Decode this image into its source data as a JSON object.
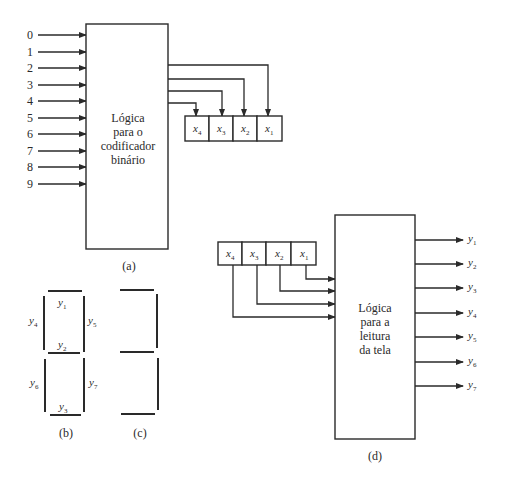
{
  "figure_a": {
    "inputs": [
      "0",
      "1",
      "2",
      "3",
      "4",
      "5",
      "6",
      "7",
      "8",
      "9"
    ],
    "block_label": [
      "Lógica",
      "para o",
      "codificador",
      "binário"
    ],
    "register": [
      {
        "name": "x",
        "sub": "4"
      },
      {
        "name": "x",
        "sub": "3"
      },
      {
        "name": "x",
        "sub": "2"
      },
      {
        "name": "x",
        "sub": "1"
      }
    ],
    "caption": "(a)"
  },
  "figure_b": {
    "segments": [
      {
        "name": "y",
        "sub": "1"
      },
      {
        "name": "y",
        "sub": "2"
      },
      {
        "name": "y",
        "sub": "3"
      },
      {
        "name": "y",
        "sub": "4"
      },
      {
        "name": "y",
        "sub": "5"
      },
      {
        "name": "y",
        "sub": "6"
      },
      {
        "name": "y",
        "sub": "7"
      }
    ],
    "caption": "(b)"
  },
  "figure_c": {
    "caption": "(c)"
  },
  "figure_d": {
    "register": [
      {
        "name": "x",
        "sub": "4"
      },
      {
        "name": "x",
        "sub": "3"
      },
      {
        "name": "x",
        "sub": "2"
      },
      {
        "name": "x",
        "sub": "1"
      }
    ],
    "block_label": [
      "Lógica",
      "para a",
      "leitura",
      "da tela"
    ],
    "outputs": [
      {
        "name": "y",
        "sub": "1"
      },
      {
        "name": "y",
        "sub": "2"
      },
      {
        "name": "y",
        "sub": "3"
      },
      {
        "name": "y",
        "sub": "4"
      },
      {
        "name": "y",
        "sub": "5"
      },
      {
        "name": "y",
        "sub": "6"
      },
      {
        "name": "y",
        "sub": "7"
      }
    ],
    "caption": "(d)"
  }
}
